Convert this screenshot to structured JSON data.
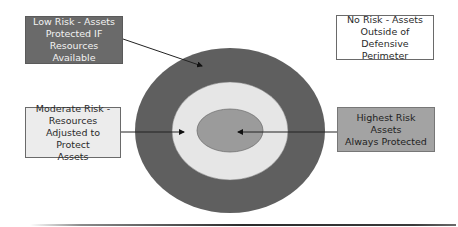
{
  "diagram": {
    "title": "",
    "type": "concentric risk zones",
    "zones": [
      {
        "id": "outside",
        "label_lines": [
          "No Risk - Assets",
          "Outside of Defensive",
          "Perimeter"
        ],
        "fill": "#ffffff",
        "text_color": "#2a2a2a"
      },
      {
        "id": "outer-ring",
        "label_lines": [
          "Low Risk - Assets",
          "Protected IF",
          "Resources Available"
        ],
        "fill": "#6a6a6a",
        "ring_color": "#5f5f5f",
        "text_color": "#f2f2f2"
      },
      {
        "id": "middle-ring",
        "label_lines": [
          "Moderate Risk -",
          "Resources",
          "Adjusted to Protect",
          "Assets"
        ],
        "fill": "#ececec",
        "ring_color": "#e6e6e6",
        "text_color": "#2a2a2a"
      },
      {
        "id": "core",
        "label_lines": [
          "Highest Risk Assets",
          "Always Protected"
        ],
        "fill": "#a3a3a3",
        "ring_color": "#9b9b9b",
        "text_color": "#1e1e1e"
      }
    ],
    "ellipses": {
      "outer": {
        "cx": 230,
        "cy": 130.5,
        "rx": 95,
        "ry": 82.5,
        "fill": "#5f5f5f"
      },
      "middle": {
        "cx": 230,
        "cy": 131,
        "rx": 58,
        "ry": 49,
        "fill": "#e6e6e6"
      },
      "core": {
        "cx": 230,
        "cy": 130.5,
        "rx": 33,
        "ry": 21.5,
        "fill": "#9b9b9b"
      }
    },
    "arrows": [
      {
        "from": "box-low",
        "x1": 123,
        "y1": 39,
        "x2": 202,
        "y2": 66
      },
      {
        "from": "box-moderate",
        "x1": 121,
        "y1": 132,
        "x2": 184,
        "y2": 132
      },
      {
        "from": "box-highest",
        "x1": 337,
        "y1": 132,
        "x2": 238,
        "y2": 132
      }
    ],
    "footer_rule": {
      "x1": 30,
      "x2": 456,
      "y": 225
    }
  }
}
